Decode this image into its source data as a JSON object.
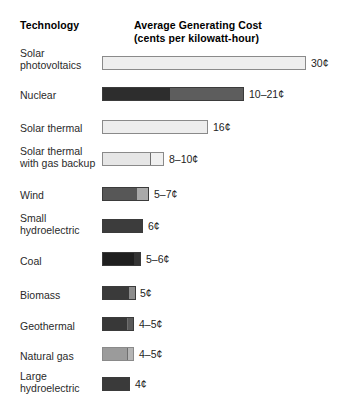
{
  "header": {
    "technology": "Technology",
    "cost_line1": "Average Generating Cost",
    "cost_line2": "(cents per kilowatt-hour)"
  },
  "chart_data": {
    "type": "bar",
    "title": "Average Generating Cost",
    "subtitle": "(cents per kilowatt-hour)",
    "xlabel": "Average Generating Cost (cents per kilowatt-hour)",
    "ylabel": "Technology",
    "orientation": "horizontal",
    "grid": false,
    "legend": "none",
    "xlim": [
      0,
      30
    ],
    "categories": [
      "Solar photovoltaics",
      "Nuclear",
      "Solar thermal",
      "Solar thermal with gas backup",
      "Wind",
      "Small hydroelectric",
      "Coal",
      "Biomass",
      "Geothermal",
      "Natural gas",
      "Large hydroelectric"
    ],
    "values": [
      30,
      21,
      16,
      10,
      7,
      6,
      6,
      5,
      5,
      5,
      4
    ],
    "ranges": [
      [
        30,
        30
      ],
      [
        10,
        21
      ],
      [
        16,
        16
      ],
      [
        8,
        10
      ],
      [
        5,
        7
      ],
      [
        6,
        6
      ],
      [
        5,
        6
      ],
      [
        5,
        5
      ],
      [
        4,
        5
      ],
      [
        4,
        5
      ],
      [
        4,
        4
      ]
    ],
    "value_labels": [
      "30¢",
      "10–21¢",
      "16¢",
      "8–10¢",
      "5–7¢",
      "6¢",
      "5–6¢",
      "5¢",
      "4–5¢",
      "4–5¢",
      "4¢"
    ]
  },
  "rows": [
    {
      "label": "Solar\nphotovoltaics",
      "label_top": 47,
      "bar_top": 56,
      "bar_width": 204,
      "value": "30¢",
      "value_left": 311,
      "segments": [
        {
          "width": 204,
          "color": "#eeeeee",
          "divider": false
        }
      ]
    },
    {
      "label": "Nuclear",
      "label_top": 89,
      "bar_top": 87,
      "bar_width": 142,
      "value": "10–21¢",
      "value_left": 249,
      "segments": [
        {
          "width": 68,
          "color": "#2d2d2d",
          "divider": false
        },
        {
          "width": 74,
          "color": "#5d5d5d",
          "divider": false
        }
      ]
    },
    {
      "label": "Solar thermal",
      "label_top": 122,
      "bar_top": 120,
      "bar_width": 106,
      "value": "16¢",
      "value_left": 213,
      "segments": [
        {
          "width": 106,
          "color": "#ededed",
          "divider": false
        }
      ]
    },
    {
      "label": "Solar thermal\nwith gas backup",
      "label_top": 145,
      "bar_top": 152,
      "bar_width": 62,
      "value": "8–10¢",
      "value_left": 169,
      "segments": [
        {
          "width": 49,
          "color": "#e6e6e6",
          "divider": false
        },
        {
          "width": 13,
          "color": "#f0f0f0",
          "divider": true
        }
      ]
    },
    {
      "label": "Wind",
      "label_top": 189,
      "bar_top": 187,
      "bar_width": 47,
      "value": "5–7¢",
      "value_left": 154,
      "segments": [
        {
          "width": 35,
          "color": "#575757",
          "divider": false
        },
        {
          "width": 12,
          "color": "#a9a9a9",
          "divider": false
        }
      ]
    },
    {
      "label": "Small\nhydroelectric",
      "label_top": 212,
      "bar_top": 219,
      "bar_width": 41,
      "value": "6¢",
      "value_left": 148,
      "segments": [
        {
          "width": 41,
          "color": "#3c3c3c",
          "divider": false
        }
      ]
    },
    {
      "label": "Coal",
      "label_top": 255,
      "bar_top": 252,
      "bar_width": 39,
      "value": "5–6¢",
      "value_left": 146,
      "segments": [
        {
          "width": 33,
          "color": "#1f1f1f",
          "divider": false
        },
        {
          "width": 6,
          "color": "#343434",
          "divider": false
        }
      ]
    },
    {
      "label": "Biomass",
      "label_top": 289,
      "bar_top": 286,
      "bar_width": 34,
      "value": "5¢",
      "value_left": 140,
      "segments": [
        {
          "width": 28,
          "color": "#3a3a3a",
          "divider": false
        },
        {
          "width": 6,
          "color": "#8c8c8c",
          "divider": false
        }
      ]
    },
    {
      "label": "Geothermal",
      "label_top": 320,
      "bar_top": 317,
      "bar_width": 32,
      "value": "4–5¢",
      "value_left": 139,
      "segments": [
        {
          "width": 26,
          "color": "#383838",
          "divider": false
        },
        {
          "width": 6,
          "color": "#595959",
          "divider": true
        }
      ]
    },
    {
      "label": "Natural gas",
      "label_top": 350,
      "bar_top": 347,
      "bar_width": 32,
      "value": "4–5¢",
      "value_left": 139,
      "segments": [
        {
          "width": 26,
          "color": "#9b9b9b",
          "divider": false
        },
        {
          "width": 6,
          "color": "#b5b5b5",
          "divider": true
        }
      ]
    },
    {
      "label": "Large\nhydroelectric",
      "label_top": 370,
      "bar_top": 377,
      "bar_width": 28,
      "value": "4¢",
      "value_left": 135,
      "segments": [
        {
          "width": 28,
          "color": "#3a3a3a",
          "divider": false
        }
      ]
    }
  ]
}
